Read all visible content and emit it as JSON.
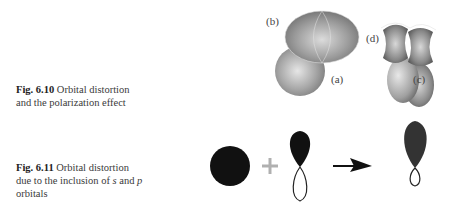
{
  "figures": [
    {
      "id": "fig-6-10",
      "number": "Fig. 6.10",
      "caption": "Orbital distortion and the polarization effect",
      "caption_lines": [
        "Orbital distortion",
        "and the polarization effect"
      ],
      "panel_labels": [
        "(a)",
        "(b)",
        "(c)",
        "(d)"
      ]
    },
    {
      "id": "fig-6-11",
      "number": "Fig. 6.11",
      "caption_lines": [
        "Orbital distortion",
        "due to the inclusion of ",
        "s",
        " and ",
        "p",
        "orbitals"
      ],
      "symbols": {
        "plus": "+",
        "arrow": "→"
      }
    }
  ]
}
